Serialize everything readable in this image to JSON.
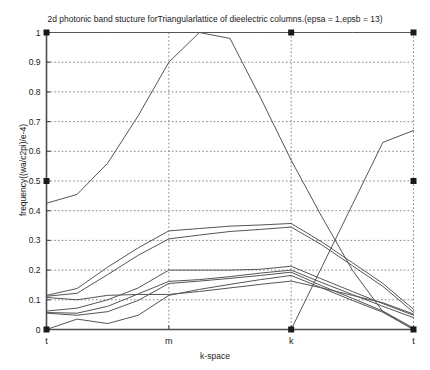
{
  "chart_data": {
    "type": "line",
    "title": "2d photonic band stucture forTriangularlattice of dieelectric columns.(epsa = 1,epsb = 13)",
    "xlabel": "k-space",
    "ylabel": "frequency((wa/c2pi)/e-4)",
    "grid": true,
    "legend": "none",
    "xlim": [
      0,
      3
    ],
    "ylim": [
      0,
      1
    ],
    "xticks": [
      0,
      1,
      2,
      3
    ],
    "xtick_labels": [
      "t",
      "m",
      "k",
      "t"
    ],
    "yticks": [
      0,
      0.1,
      0.2,
      0.3,
      0.4,
      0.5,
      0.6,
      0.7,
      0.8,
      0.9,
      1
    ],
    "ytick_labels": [
      "0",
      "0.1",
      "0.2",
      "0.3",
      "0.4",
      "0.5",
      "0.6",
      "0.7",
      "0.8",
      "0.9",
      "1"
    ],
    "x": [
      0,
      0.25,
      0.5,
      0.75,
      1,
      1.25,
      1.5,
      1.75,
      2,
      2.25,
      2.5,
      2.75,
      3
    ],
    "series": [
      {
        "name": "band-1",
        "values": [
          0.0,
          0.035,
          0.02,
          0.048,
          0.115,
          0.135,
          0.152,
          0.168,
          0.182,
          0.14,
          0.098,
          0.058,
          0.0
        ]
      },
      {
        "name": "band-2",
        "values": [
          0.055,
          0.048,
          0.06,
          0.098,
          0.155,
          0.163,
          0.172,
          0.182,
          0.193,
          0.147,
          0.105,
          0.062,
          0.005
        ]
      },
      {
        "name": "band-3",
        "values": [
          0.057,
          0.055,
          0.078,
          0.12,
          0.162,
          0.168,
          0.178,
          0.19,
          0.2,
          0.158,
          0.118,
          0.078,
          0.04
        ]
      },
      {
        "name": "band-4",
        "values": [
          0.062,
          0.072,
          0.1,
          0.14,
          0.2,
          0.2,
          0.2,
          0.203,
          0.213,
          0.17,
          0.128,
          0.087,
          0.048
        ]
      },
      {
        "name": "band-5",
        "values": [
          0.108,
          0.1,
          0.115,
          0.118,
          0.118,
          0.128,
          0.14,
          0.152,
          0.163,
          0.14,
          0.115,
          0.09,
          0.052
        ]
      },
      {
        "name": "band-6",
        "values": [
          0.112,
          0.122,
          0.185,
          0.25,
          0.305,
          0.318,
          0.33,
          0.337,
          0.345,
          0.285,
          0.215,
          0.145,
          0.058
        ]
      },
      {
        "name": "band-7",
        "values": [
          0.115,
          0.138,
          0.21,
          0.275,
          0.332,
          0.34,
          0.348,
          0.352,
          0.357,
          0.295,
          0.225,
          0.155,
          0.068
        ]
      },
      {
        "name": "band-8",
        "values": [
          0.425,
          0.455,
          0.56,
          0.72,
          0.9,
          1.0,
          1.0,
          1.0,
          1.0,
          1.0,
          1.0,
          1.0,
          1.0
        ]
      },
      {
        "name": "band-9-descending",
        "values": [
          1.0,
          1.0,
          1.0,
          1.0,
          1.0,
          1.0,
          0.98,
          0.78,
          0.57,
          0.38,
          0.2,
          0.06,
          0.0
        ]
      },
      {
        "name": "band-10-ascending",
        "values": [
          0.0,
          0.0,
          0.0,
          0.0,
          0.0,
          0.0,
          0.0,
          0.0,
          0.0,
          0.21,
          0.42,
          0.63,
          0.67
        ]
      }
    ],
    "markers": [
      {
        "name": "marker-top-left",
        "x": 0,
        "y": 1
      },
      {
        "name": "marker-top-mid",
        "x": 2,
        "y": 1
      },
      {
        "name": "marker-top-right",
        "x": 3,
        "y": 1
      },
      {
        "name": "marker-left-half",
        "x": 0,
        "y": 0.5
      },
      {
        "name": "marker-right-half",
        "x": 3,
        "y": 0.5
      },
      {
        "name": "marker-bottom-left",
        "x": 0,
        "y": 0
      },
      {
        "name": "marker-bottom-mid",
        "x": 2,
        "y": 0
      },
      {
        "name": "marker-bottom-right",
        "x": 3,
        "y": 0
      }
    ],
    "colors": {
      "line": "#555555",
      "grid": "#777777",
      "axis": "#4d4d4d",
      "marker": "#1a1a1a",
      "background": "#ffffff"
    }
  }
}
